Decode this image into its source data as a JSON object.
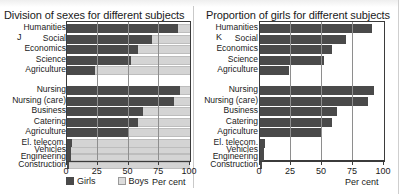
{
  "chart_data": [
    {
      "type": "bar",
      "subtype": "stacked-horizontal",
      "title": "Division of sexes for different subjects",
      "group_letter": "J",
      "xlabel": "Per cent",
      "ylabel": "",
      "xlim": [
        0,
        100
      ],
      "xticks": [
        0,
        25,
        50,
        75,
        100
      ],
      "xticklabels": [
        "0",
        "25",
        "50",
        "75",
        "100"
      ],
      "grid": true,
      "legend": [
        "Girls",
        "Boys"
      ],
      "legend_position": "below-axis",
      "categories": [
        "Humanities",
        "Social",
        "Economics",
        "Science",
        "Agriculture",
        "Nursing",
        "Nursing (care)",
        "Business",
        "Catering",
        "Agriculture",
        "El. telecom.",
        "Vehicles",
        "Engineering",
        "Construction"
      ],
      "series": [
        {
          "name": "Girls",
          "values": [
            90,
            69,
            58,
            52,
            23,
            92,
            87,
            62,
            58,
            50,
            4,
            3.5,
            3,
            1.5
          ]
        },
        {
          "name": "Boys",
          "values": [
            10,
            31,
            42,
            48,
            77,
            8,
            13,
            38,
            42,
            50,
            96,
            96.5,
            97,
            98.5
          ]
        }
      ]
    },
    {
      "type": "bar",
      "subtype": "horizontal",
      "title": "Proportion of girls for different subjects",
      "group_letter": "K",
      "xlabel": "Per cent",
      "ylabel": "",
      "xlim": [
        0,
        100
      ],
      "xticks": [
        0,
        25,
        50,
        75,
        100
      ],
      "xticklabels": [
        "0",
        "25",
        "50",
        "75",
        "100"
      ],
      "grid": true,
      "categories": [
        "Humanities",
        "Social",
        "Economics",
        "Science",
        "Agriculture",
        "Nursing",
        "Nursing (care)",
        "Business",
        "Catering",
        "Agriculture",
        "El. telecom.",
        "Vehicles",
        "Engineering",
        "Construction"
      ],
      "values": [
        90,
        69,
        58,
        52,
        23,
        92,
        87,
        62,
        58,
        50,
        4,
        3.5,
        3,
        1.5
      ]
    }
  ],
  "colors": {
    "girls": "#4a4a4a",
    "boys": "#d4d4d4",
    "axis": "#3b3b3b",
    "grid": "#8e8e8e"
  }
}
